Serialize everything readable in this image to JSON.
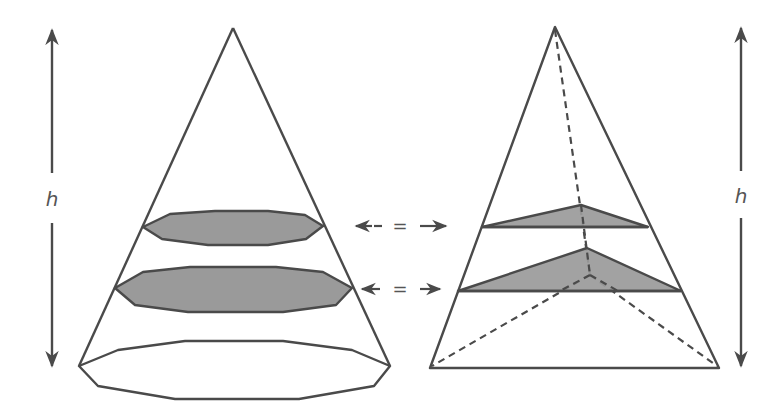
{
  "figure": {
    "left_solid": {
      "type": "cone",
      "height_label": "h",
      "apex": [
        233,
        28
      ],
      "base_polygon": [
        [
          79,
          366
        ],
        [
          118,
          350
        ],
        [
          185,
          341
        ],
        [
          283,
          341
        ],
        [
          352,
          350
        ],
        [
          390,
          366
        ],
        [
          374,
          386
        ],
        [
          299,
          399
        ],
        [
          175,
          399
        ],
        [
          98,
          386
        ]
      ],
      "cross_sections": [
        {
          "polygon": [
            [
              143,
              227
            ],
            [
              170,
              214
            ],
            [
              215,
              211
            ],
            [
              268,
              211
            ],
            [
              305,
              215
            ],
            [
              323,
              226
            ],
            [
              306,
              239
            ],
            [
              268,
              245
            ],
            [
              208,
              245
            ],
            [
              162,
              239
            ]
          ]
        },
        {
          "polygon": [
            [
              115,
              288
            ],
            [
              143,
              272
            ],
            [
              190,
              267
            ],
            [
              276,
              267
            ],
            [
              323,
              272
            ],
            [
              352,
              288
            ],
            [
              336,
              305
            ],
            [
              283,
              312
            ],
            [
              188,
              312
            ],
            [
              135,
              305
            ]
          ]
        }
      ]
    },
    "right_solid": {
      "type": "triangular pyramid",
      "height_label": "h",
      "apex": [
        555,
        27
      ],
      "base_front": [
        [
          430,
          368
        ],
        [
          719,
          368
        ]
      ],
      "base_back_vertex": [
        590,
        275
      ],
      "cross_sections": [
        {
          "polygon": [
            [
              482,
              227
            ],
            [
              581,
              205
            ],
            [
              648,
              227
            ]
          ]
        },
        {
          "polygon": [
            [
              458,
              291
            ],
            [
              587,
              248
            ],
            [
              681,
              291
            ]
          ]
        }
      ]
    },
    "comparison_markers": [
      {
        "symbol": "=",
        "y": 226
      },
      {
        "symbol": "=",
        "y": 289
      }
    ],
    "colors": {
      "stroke": "#4a4a4a",
      "fill_section": "#9a9a9a",
      "background": "#ffffff",
      "text": "#555555"
    }
  }
}
